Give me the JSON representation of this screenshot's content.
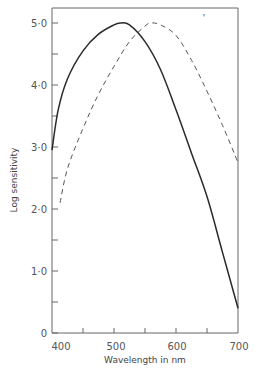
{
  "chart_data": {
    "type": "line",
    "title": "",
    "xlabel": "Wavelength in nm",
    "ylabel": "Log sensitivity",
    "xlim": [
      400,
      700
    ],
    "ylim": [
      0,
      5.2
    ],
    "x_ticks": [
      400,
      500,
      600,
      700
    ],
    "x_ticks_minor": [
      450,
      550,
      650
    ],
    "x_tick_labels": [
      "400",
      "500",
      "600",
      "700"
    ],
    "y_ticks": [
      0,
      1.0,
      2.0,
      3.0,
      4.0,
      5.0
    ],
    "y_ticks_minor": [
      0.5,
      1.5,
      2.5,
      3.5,
      4.5
    ],
    "y_tick_labels": [
      "0",
      "1·0",
      "2·0",
      "3·0",
      "4·0",
      "5·0"
    ],
    "grid": false,
    "legend": null,
    "annotations": [
      "'"
    ],
    "series": [
      {
        "name": "solid curve",
        "style": "solid",
        "x": [
          400,
          410,
          425,
          450,
          475,
          500,
          510,
          525,
          550,
          575,
          600,
          625,
          650,
          675,
          700
        ],
        "values": [
          2.95,
          3.6,
          4.1,
          4.55,
          4.82,
          4.97,
          5.0,
          4.97,
          4.7,
          4.25,
          3.6,
          2.9,
          2.2,
          1.3,
          0.4
        ]
      },
      {
        "name": "dashed curve",
        "style": "dashed",
        "x": [
          413,
          425,
          450,
          475,
          500,
          525,
          550,
          560,
          575,
          600,
          625,
          650,
          675,
          700
        ],
        "values": [
          2.1,
          2.65,
          3.3,
          3.85,
          4.3,
          4.7,
          4.95,
          5.0,
          4.97,
          4.8,
          4.4,
          3.9,
          3.35,
          2.75
        ]
      }
    ]
  },
  "labels": {
    "xlabel": "Wavelength in nm",
    "ylabel": "Log sensitivity",
    "x0": "400",
    "x1": "500",
    "x2": "600",
    "x3": "700",
    "y0": "0",
    "y1": "1·0",
    "y2": "2·0",
    "y3": "3·0",
    "y4": "4·0",
    "y5": "5·0",
    "mark": "'"
  }
}
